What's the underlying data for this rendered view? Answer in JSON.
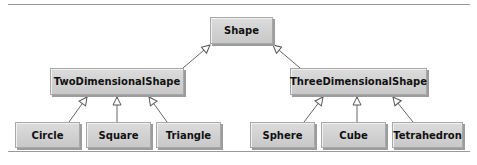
{
  "diagram": {
    "type": "uml-class-hierarchy",
    "nodes": {
      "shape": "Shape",
      "two_d": "TwoDimensionalShape",
      "three_d": "ThreeDimensionalShape",
      "circle": "Circle",
      "square": "Square",
      "triangle": "Triangle",
      "sphere": "Sphere",
      "cube": "Cube",
      "tetrahedron": "Tetrahedron"
    },
    "edges": [
      {
        "from": "TwoDimensionalShape",
        "to": "Shape",
        "kind": "inheritance"
      },
      {
        "from": "ThreeDimensionalShape",
        "to": "Shape",
        "kind": "inheritance"
      },
      {
        "from": "Circle",
        "to": "TwoDimensionalShape",
        "kind": "inheritance"
      },
      {
        "from": "Square",
        "to": "TwoDimensionalShape",
        "kind": "inheritance"
      },
      {
        "from": "Triangle",
        "to": "TwoDimensionalShape",
        "kind": "inheritance"
      },
      {
        "from": "Sphere",
        "to": "ThreeDimensionalShape",
        "kind": "inheritance"
      },
      {
        "from": "Cube",
        "to": "ThreeDimensionalShape",
        "kind": "inheritance"
      },
      {
        "from": "Tetrahedron",
        "to": "ThreeDimensionalShape",
        "kind": "inheritance"
      }
    ]
  }
}
